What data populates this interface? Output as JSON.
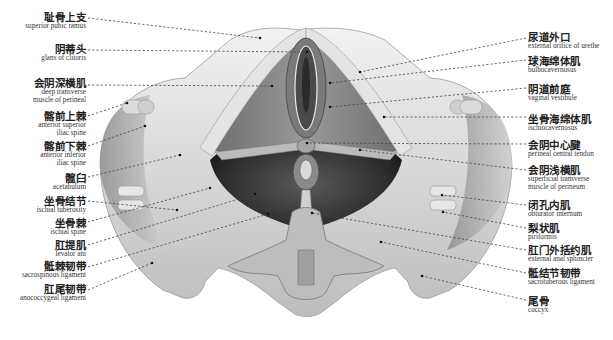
{
  "figure": {
    "style": "grayscale anatomical illustration with dashed leader lines"
  },
  "labels_left": [
    {
      "zh": "耻骨上支",
      "en": "superior pubic ramus",
      "y": 12
    },
    {
      "zh": "阴蒂头",
      "en": "glans of clitoris",
      "y": 44
    },
    {
      "zh": "会阴深横肌",
      "en": "deep transverse\nmuscle of perineal",
      "y": 78
    },
    {
      "zh": "髂前上棘",
      "en": "anterior superior\niliac spine",
      "y": 111
    },
    {
      "zh": "髂前下棘",
      "en": "anterior inferior\niliac spine",
      "y": 141
    },
    {
      "zh": "髋臼",
      "en": "acetabulum",
      "y": 173
    },
    {
      "zh": "坐骨结节",
      "en": "ischial tuberosity",
      "y": 196
    },
    {
      "zh": "坐骨棘",
      "en": "ischial spine",
      "y": 218
    },
    {
      "zh": "肛提肌",
      "en": "levator ani",
      "y": 240
    },
    {
      "zh": "骶棘韧带",
      "en": "sacrospinous ligament",
      "y": 261
    },
    {
      "zh": "肛尾韧带",
      "en": "anococcygeal ligament",
      "y": 284
    }
  ],
  "labels_right": [
    {
      "zh": "尿道外口",
      "en": "external orifice of urethe",
      "y": 32
    },
    {
      "zh": "球海绵体肌",
      "en": "bulbocavernosus",
      "y": 56
    },
    {
      "zh": "阴道前庭",
      "en": "vaginal vestibule",
      "y": 84
    },
    {
      "zh": "坐骨海绵体肌",
      "en": "ischiocavernosus",
      "y": 114
    },
    {
      "zh": "会阴中心腱",
      "en": "perineal central tendon",
      "y": 140
    },
    {
      "zh": "会阴浅横肌",
      "en": "superficial transverse\nmuscle of  perineum",
      "y": 165
    },
    {
      "zh": "闭孔内肌",
      "en": "obturator internum",
      "y": 200
    },
    {
      "zh": "梨状肌",
      "en": "piriformis",
      "y": 223
    },
    {
      "zh": "肛门外括约肌",
      "en": "external anal sphincter",
      "y": 245
    },
    {
      "zh": "骶结节韧带",
      "en": "sacrotuberous ligament",
      "y": 268
    },
    {
      "zh": "尾骨",
      "en": "coccyx",
      "y": 296
    }
  ],
  "leaders_left": [
    [
      88,
      18,
      260,
      38
    ],
    [
      88,
      50,
      307,
      52
    ],
    [
      88,
      85,
      272,
      86
    ],
    [
      88,
      116,
      127,
      103
    ],
    [
      88,
      146,
      145,
      126
    ],
    [
      88,
      177,
      180,
      155
    ],
    [
      88,
      201,
      177,
      210
    ],
    [
      88,
      222,
      210,
      188
    ],
    [
      88,
      245,
      255,
      194
    ],
    [
      88,
      267,
      268,
      214
    ],
    [
      88,
      290,
      152,
      263
    ]
  ],
  "leaders_right": [
    [
      526,
      38,
      360,
      72
    ],
    [
      526,
      60,
      330,
      83
    ],
    [
      526,
      88,
      330,
      107
    ],
    [
      526,
      117,
      384,
      117
    ],
    [
      526,
      144,
      307,
      143
    ],
    [
      526,
      170,
      360,
      150
    ],
    [
      526,
      205,
      442,
      195
    ],
    [
      526,
      228,
      443,
      212
    ],
    [
      526,
      250,
      312,
      213
    ],
    [
      526,
      273,
      381,
      242
    ],
    [
      526,
      300,
      422,
      276
    ]
  ]
}
